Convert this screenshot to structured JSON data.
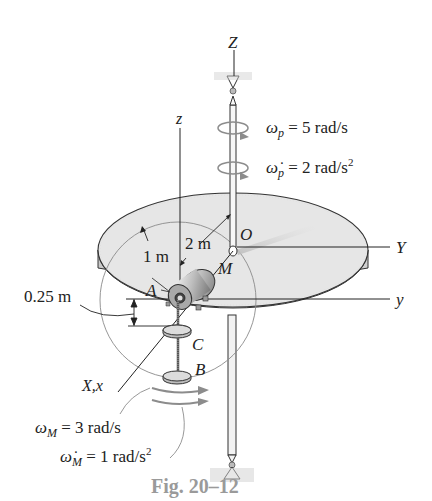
{
  "figure": {
    "caption": "Fig. 20–12",
    "axes": {
      "Z": "Z",
      "Y": "Y",
      "z": "z",
      "y": "y",
      "Xx": "X,x"
    },
    "points": {
      "O": "O",
      "M": "M",
      "A": "A",
      "B": "B",
      "C": "C"
    },
    "dimensions": {
      "r_outer": "2 m",
      "r_inner": "1 m",
      "offset": "0.25 m"
    },
    "platform": {
      "omega_sym": "ω",
      "omega_sub": "p",
      "omega_val": " = 5 rad/s",
      "alpha_sym": "ω̇",
      "alpha_sub": "p",
      "alpha_val": " = 2 rad/s",
      "alpha_exp": "2"
    },
    "motor": {
      "omega_sym": "ω",
      "omega_sub": "M",
      "omega_val": " = 3 rad/s",
      "alpha_sym": "ω̇",
      "alpha_sub": "M",
      "alpha_val": " = 1 rad/s",
      "alpha_exp": "2"
    },
    "colors": {
      "disk_fill": "#e6e6e6",
      "disk_side": "#d2d2d2",
      "line": "#222222",
      "gray_arrow": "#8c8c8c",
      "caption": "#9a9a9a"
    }
  }
}
